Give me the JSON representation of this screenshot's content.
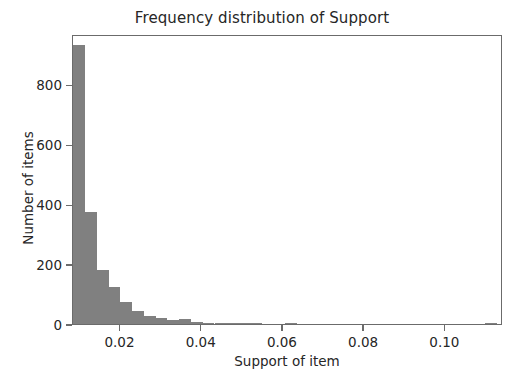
{
  "chart_data": {
    "type": "bar",
    "title": "Frequency distribution of Support",
    "xlabel": "Support of item",
    "ylabel": "Number of items",
    "xlim": [
      0.0083,
      0.1142
    ],
    "ylim": [
      0,
      968
    ],
    "grid": false,
    "legend": null,
    "bar_color": "#808080",
    "bin_width": 0.0029,
    "xticks": [
      0.02,
      0.04,
      0.06,
      0.08,
      0.1
    ],
    "xtick_labels": [
      "0.02",
      "0.04",
      "0.06",
      "0.08",
      "0.10"
    ],
    "yticks": [
      0,
      200,
      400,
      600,
      800
    ],
    "ytick_labels": [
      "0",
      "200",
      "400",
      "600",
      "800"
    ],
    "bin_centers": [
      0.0098,
      0.0127,
      0.0156,
      0.0185,
      0.0214,
      0.0243,
      0.0272,
      0.0301,
      0.033,
      0.0359,
      0.0388,
      0.0417,
      0.0446,
      0.0475,
      0.0504,
      0.0533,
      0.0562,
      0.0591,
      0.062,
      0.0649,
      0.0678,
      0.0707,
      0.0736,
      0.0765,
      0.0794,
      0.0823,
      0.0852,
      0.0881,
      0.091,
      0.0939,
      0.0968,
      0.0997,
      0.1026,
      0.1055,
      0.1084,
      0.1113
    ],
    "values": [
      930,
      375,
      180,
      123,
      72,
      43,
      27,
      21,
      14,
      18,
      6,
      4,
      2,
      5,
      2,
      1,
      0,
      0,
      1,
      0,
      0,
      0,
      0,
      0,
      0,
      0,
      0,
      0,
      0,
      0,
      0,
      0,
      0,
      0,
      0,
      1
    ]
  }
}
